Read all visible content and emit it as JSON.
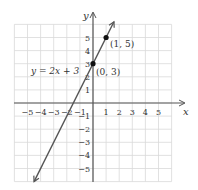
{
  "chart_data": {
    "type": "line",
    "title": "",
    "xlabel": "x",
    "ylabel": "y",
    "xlim": [
      -6,
      6
    ],
    "ylim": [
      -6,
      6
    ],
    "grid": true,
    "x_ticks": [
      "−5",
      "−4",
      "−3",
      "−2",
      "−1",
      "1",
      "2",
      "3",
      "4",
      "5"
    ],
    "y_ticks": [
      "5",
      "4",
      "3",
      "2",
      "1",
      "−1",
      "−2",
      "−3",
      "−4",
      "−5"
    ],
    "series": [
      {
        "name": "y = 2x + 3",
        "slope": 2,
        "intercept": 3,
        "x": [
          -4.5,
          1.6
        ],
        "y": [
          -6,
          6.2
        ],
        "color": "#555555"
      }
    ],
    "points": [
      {
        "x": 0,
        "y": 3,
        "label": "(0, 3)"
      },
      {
        "x": 1,
        "y": 5,
        "label": "(1, 5)"
      }
    ],
    "annotations": [
      {
        "text": "y = 2x + 3",
        "near": [
          -2.5,
          3
        ]
      }
    ]
  },
  "labels": {
    "x_axis": "x",
    "y_axis": "y",
    "equation": "y = 2x + 3",
    "point_a": "(0, 3)",
    "point_b": "(1, 5)"
  },
  "colors": {
    "grid": "#d9d9d9",
    "axis": "#555555",
    "line": "#555555",
    "point": "#111111"
  }
}
